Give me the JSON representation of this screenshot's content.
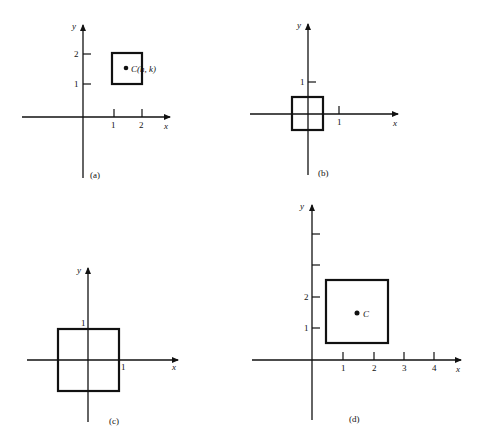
{
  "figure": {
    "panels": [
      {
        "id": "a",
        "caption": "(a)",
        "x_axis_label": "x",
        "y_axis_label": "y",
        "x_ticks": [
          "1",
          "2"
        ],
        "y_ticks": [
          "1",
          "2"
        ],
        "square": {
          "x_min": 1,
          "x_max": 2,
          "y_min": 1,
          "y_max": 2
        },
        "center_point": {
          "x": 1.5,
          "y": 1.5,
          "label": "C(h, k)"
        }
      },
      {
        "id": "b",
        "caption": "(b)",
        "x_axis_label": "x",
        "y_axis_label": "y",
        "x_ticks": [
          "1"
        ],
        "y_ticks": [
          "1"
        ],
        "square": {
          "x_min": -0.5,
          "x_max": 0.5,
          "y_min": -0.5,
          "y_max": 0.5
        }
      },
      {
        "id": "c",
        "caption": "(c)",
        "x_axis_label": "x",
        "y_axis_label": "y",
        "x_ticks": [
          "1"
        ],
        "y_ticks": [
          "1"
        ],
        "square": {
          "x_min": -1,
          "x_max": 1,
          "y_min": -1,
          "y_max": 1
        }
      },
      {
        "id": "d",
        "caption": "(d)",
        "x_axis_label": "x",
        "y_axis_label": "y",
        "x_ticks": [
          "1",
          "2",
          "3",
          "4"
        ],
        "y_ticks": [
          "1",
          "2"
        ],
        "square": {
          "x_min": 0.5,
          "x_max": 2.5,
          "y_min": 0.5,
          "y_max": 2.5
        },
        "center_point": {
          "x": 1.5,
          "y": 1.5,
          "label": "C"
        }
      }
    ]
  }
}
